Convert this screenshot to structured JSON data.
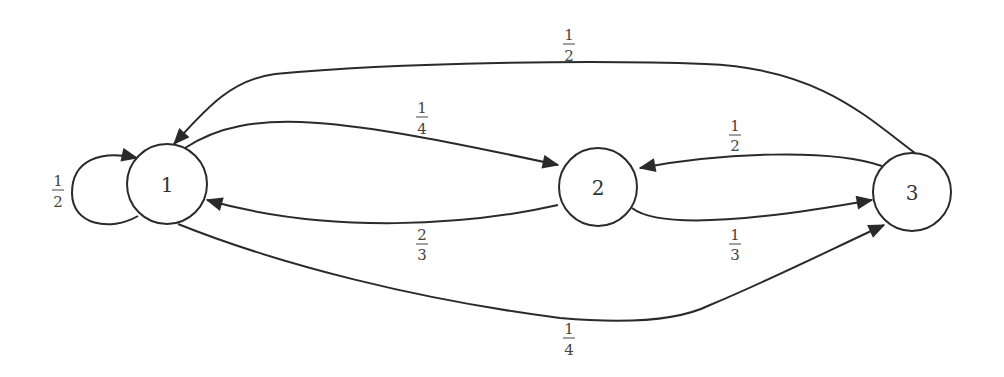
{
  "diagram": {
    "type": "markov-chain-state-diagram",
    "nodes": [
      {
        "id": "1",
        "label": "1"
      },
      {
        "id": "2",
        "label": "2"
      },
      {
        "id": "3",
        "label": "3"
      }
    ],
    "edges": [
      {
        "from": "1",
        "to": "1",
        "num": "1",
        "den": "2"
      },
      {
        "from": "1",
        "to": "2",
        "num": "1",
        "den": "4"
      },
      {
        "from": "1",
        "to": "3",
        "num": "1",
        "den": "4"
      },
      {
        "from": "2",
        "to": "1",
        "num": "2",
        "den": "3"
      },
      {
        "from": "2",
        "to": "3",
        "num": "1",
        "den": "3"
      },
      {
        "from": "3",
        "to": "1",
        "num": "1",
        "den": "2"
      },
      {
        "from": "3",
        "to": "2",
        "num": "1",
        "den": "2"
      }
    ]
  }
}
